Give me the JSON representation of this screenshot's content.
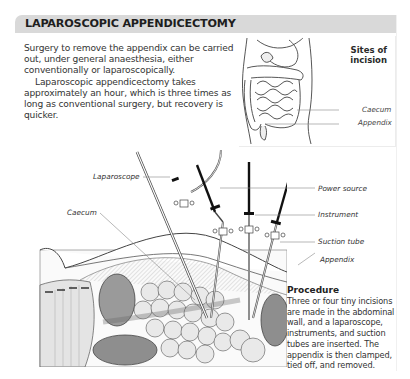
{
  "header": {
    "title": "LAPAROSCOPIC APPENDICECTOMY",
    "background": "#d9d9d9"
  },
  "intro": {
    "paragraph1": "Surgery to remove the appendix can be carried out, under general anaesthesia, either conventionally or laparoscopically.",
    "paragraph2": "Laparoscopic appendicectomy takes approximately an hour, which is three times as long as conventional surgery, but recovery is quicker."
  },
  "inset": {
    "title": "Sites of incision",
    "labels": {
      "caecum": "Caecum",
      "appendix": "Appendix"
    }
  },
  "diagram": {
    "labels": {
      "laparoscope": "Laparoscope",
      "caecum": "Caecum",
      "power_source": "Power source",
      "instrument": "Instrument",
      "suction_tube": "Suction tube",
      "appendix": "Appendix"
    }
  },
  "procedure": {
    "title": "Procedure",
    "text": "Three or four tiny incisions are made in the abdominal wall, and a laparoscope, instruments, and suction tubes are inserted. The appendix is then clamped, tied off, and removed."
  }
}
